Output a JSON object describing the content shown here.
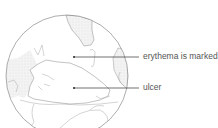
{
  "diagram": {
    "labels": [
      {
        "id": "erythema",
        "text": "erythema is marked"
      },
      {
        "id": "ulcer",
        "text": "ulcer"
      }
    ],
    "colors": {
      "outline": "#9a9a9a",
      "leader": "#333333",
      "shade": "#eeeeee",
      "text": "#555555"
    }
  }
}
